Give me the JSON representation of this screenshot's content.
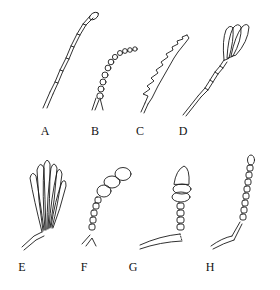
{
  "figure": {
    "panels": [
      {
        "id": "A",
        "label": "A",
        "type": "filiform"
      },
      {
        "id": "B",
        "label": "B",
        "type": "moniliform"
      },
      {
        "id": "C",
        "label": "C",
        "type": "serrate"
      },
      {
        "id": "D",
        "label": "D",
        "type": "lamellate"
      },
      {
        "id": "E",
        "label": "E",
        "type": "flabellate"
      },
      {
        "id": "F",
        "label": "F",
        "type": "clavate"
      },
      {
        "id": "G",
        "label": "G",
        "type": "capitate"
      },
      {
        "id": "H",
        "label": "H",
        "type": "clubbed / gradually thickened"
      }
    ],
    "colors": {
      "ink": "#1a1a1a",
      "background": "#ffffff"
    }
  }
}
